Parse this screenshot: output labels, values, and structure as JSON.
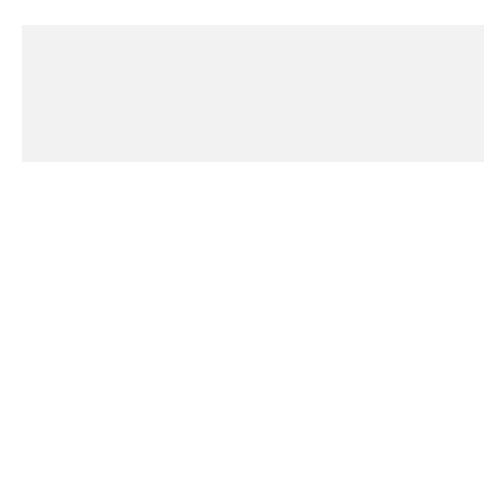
{
  "figure": {
    "number": "FIGURE 15.3"
  },
  "title_box": {
    "label": "Title"
  },
  "sections": {
    "introduction": {
      "label": "Introduction",
      "content": [
        "Background information about the event",
        "or phenomenon",
        "Thesis statement"
      ]
    },
    "body": {
      "label": "Body Paragraphs",
      "connector": "or",
      "arrangement_1": {
        "header": "Arrangement 1",
        "causes": [
          "Cause A",
          "Cause B",
          "Cause C"
        ],
        "effects": [
          "Effect A",
          "Effect B",
          "Effect C"
        ]
      },
      "arrangement_2": {
        "header": "Arrangement 2",
        "pairs": [
          [
            "Cause A",
            "Effect A"
          ],
          [
            "Cause B",
            "Effect B"
          ],
          [
            "Cause C",
            "Effect C"
          ]
        ]
      }
    },
    "conclusion": {
      "label": "Conclusion",
      "content": [
        "Reminder of thesis",
        "Final statement"
      ]
    }
  },
  "colors": {
    "panel_background": "#f2f2f2",
    "box_fill": "#bdbdbd",
    "header_fill": "#c9c9c9",
    "line": "#111111"
  }
}
